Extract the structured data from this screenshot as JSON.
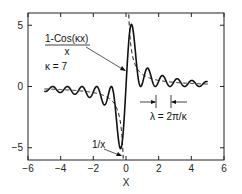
{
  "chart_data": {
    "type": "line",
    "title": "",
    "xlabel": "X",
    "ylabel": "",
    "xlim": [
      -6,
      6
    ],
    "ylim": [
      -6,
      6
    ],
    "xticks": [
      -6,
      -4,
      -2,
      0,
      2,
      4,
      6
    ],
    "xtick_labels": [
      "−6",
      "−4",
      "−2",
      "0",
      "2",
      "4",
      "6"
    ],
    "yticks": [
      -5,
      0,
      5
    ],
    "ytick_labels": [
      "−5",
      "0",
      "5"
    ],
    "grid": false,
    "kappa": 7,
    "x_range": [
      -5,
      5
    ],
    "series": [
      {
        "name": "1-Cos(κx)/x",
        "style": "solid",
        "formula": "(1-cos(kappa*x))/x"
      },
      {
        "name": "1/x",
        "style": "dashed",
        "formula": "1/x"
      }
    ],
    "annotations": {
      "formula_numerator": "1-Cos(κx)",
      "formula_denominator": "x",
      "kappa_label": "κ = 7",
      "inverse_label": "1/x",
      "wavelength_label": "λ = 2π/κ"
    }
  }
}
